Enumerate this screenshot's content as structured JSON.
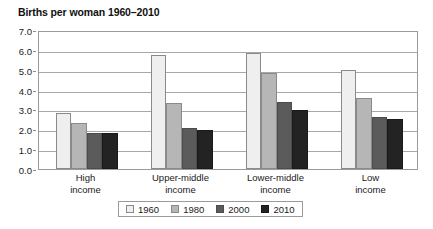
{
  "chart_data": {
    "type": "bar",
    "title": "Births per woman 1960–2010",
    "xlabel": "",
    "ylabel": "",
    "ylim": [
      0.0,
      7.0
    ],
    "ytick_step": 1.0,
    "ytick_labels": [
      "7.0",
      "6.0",
      "5.0",
      "4.0",
      "3.0",
      "2.0",
      "1.0",
      "0.0"
    ],
    "ytick_values": [
      7.0,
      6.0,
      5.0,
      4.0,
      3.0,
      2.0,
      1.0,
      0.0
    ],
    "grid": true,
    "grid_axis": "y",
    "legend_position": "bottom",
    "categories": [
      "High income",
      "Upper-middle income",
      "Lower-middle income",
      "Low income"
    ],
    "category_lines": [
      [
        "High",
        "income"
      ],
      [
        "Upper-middle",
        "income"
      ],
      [
        "Lower-middle",
        "income"
      ],
      [
        "Low",
        "income"
      ]
    ],
    "series": [
      {
        "name": "1960",
        "color": "#efefef",
        "values": [
          2.8,
          5.75,
          5.85,
          5.0
        ]
      },
      {
        "name": "1980",
        "color": "#b6b6b6",
        "values": [
          2.3,
          3.3,
          4.85,
          3.6
        ]
      },
      {
        "name": "2000",
        "color": "#5b5b5b",
        "values": [
          1.8,
          2.05,
          3.4,
          2.6
        ]
      },
      {
        "name": "2010",
        "color": "#232323",
        "values": [
          1.8,
          1.95,
          2.95,
          2.5
        ]
      }
    ]
  },
  "legend": {
    "items": [
      {
        "label": "1960",
        "swatch": "legend-swatch-1960"
      },
      {
        "label": "1980",
        "swatch": "legend-swatch-1980"
      },
      {
        "label": "2000",
        "swatch": "legend-swatch-2000"
      },
      {
        "label": "2010",
        "swatch": "legend-swatch-2010"
      }
    ]
  }
}
